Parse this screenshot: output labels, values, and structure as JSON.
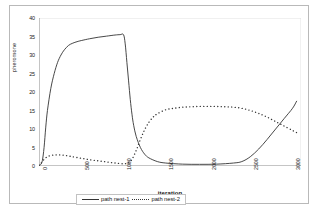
{
  "chart_data": {
    "type": "line",
    "title": "",
    "xlabel": "iteration",
    "ylabel": "pheromone",
    "xlim": [
      0,
      3100
    ],
    "ylim": [
      0,
      40
    ],
    "xticks": [
      "0",
      "500",
      "1000",
      "1500",
      "2000",
      "2500",
      "3000"
    ],
    "xtick_values": [
      0,
      500,
      1000,
      1500,
      2000,
      2500,
      3000
    ],
    "yticks": [
      "0",
      "5",
      "10",
      "15",
      "20",
      "25",
      "30",
      "35",
      "40"
    ],
    "ytick_values": [
      0,
      5,
      10,
      15,
      20,
      25,
      30,
      35,
      40
    ],
    "grid": false,
    "legend_position": "bottom",
    "series": [
      {
        "name": "path nest-1",
        "style": "solid",
        "color": "#333333",
        "x": [
          0,
          20,
          40,
          60,
          80,
          100,
          140,
          180,
          220,
          260,
          300,
          350,
          400,
          450,
          500,
          600,
          700,
          800,
          900,
          960,
          1000,
          1020,
          1040,
          1060,
          1080,
          1100,
          1120,
          1150,
          1200,
          1250,
          1300,
          1400,
          1500,
          1700,
          1900,
          2100,
          2300,
          2400,
          2500,
          2600,
          2700,
          2800,
          2900,
          3000,
          3050
        ],
        "y": [
          0.2,
          0.4,
          1.5,
          5.0,
          10.5,
          15.0,
          21.0,
          25.0,
          28.0,
          30.0,
          31.4,
          32.6,
          33.2,
          33.6,
          33.9,
          34.4,
          34.8,
          35.1,
          35.4,
          35.5,
          35.5,
          33.0,
          28.0,
          23.0,
          18.0,
          14.0,
          11.0,
          8.0,
          5.0,
          3.2,
          2.2,
          1.2,
          0.8,
          0.5,
          0.45,
          0.5,
          0.8,
          1.2,
          2.5,
          4.6,
          7.2,
          10.0,
          12.8,
          15.6,
          17.6
        ]
      },
      {
        "name": "path nest-2",
        "style": "dotted",
        "color": "#333333",
        "x": [
          0,
          20,
          60,
          100,
          150,
          200,
          250,
          300,
          350,
          400,
          500,
          600,
          700,
          800,
          900,
          1000,
          1060,
          1100,
          1150,
          1200,
          1250,
          1300,
          1350,
          1400,
          1500,
          1600,
          1700,
          1800,
          1900,
          2000,
          2100,
          2200,
          2300,
          2400,
          2500,
          2600,
          2700,
          2800,
          2900,
          3000,
          3050
        ],
        "y": [
          0.2,
          0.6,
          1.8,
          2.5,
          2.9,
          3.0,
          3.0,
          2.9,
          2.7,
          2.5,
          2.1,
          1.7,
          1.4,
          1.1,
          0.8,
          0.6,
          0.9,
          1.8,
          4.2,
          7.2,
          9.8,
          11.8,
          13.2,
          14.1,
          15.2,
          15.6,
          15.9,
          16.0,
          16.1,
          16.1,
          16.1,
          16.0,
          15.9,
          15.6,
          15.0,
          14.2,
          13.2,
          12.0,
          10.8,
          9.6,
          9.0
        ]
      }
    ],
    "annotations": []
  }
}
